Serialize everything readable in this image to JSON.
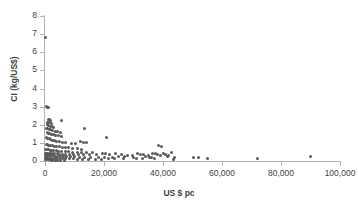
{
  "chart_data": {
    "type": "scatter",
    "title": "",
    "xlabel": "US $ pc",
    "ylabel": "CI (kg/US$)",
    "xlim": [
      0,
      100000
    ],
    "ylim": [
      0,
      8
    ],
    "xticks": [
      0,
      20000,
      40000,
      60000,
      80000,
      100000
    ],
    "xtick_labels": [
      "0",
      "20,000",
      "40,000",
      "60,000",
      "80,000",
      "100,000"
    ],
    "yticks": [
      0,
      1,
      2,
      3,
      4,
      5,
      6,
      7,
      8
    ],
    "ytick_labels": [
      "0",
      "1",
      "2",
      "3",
      "4",
      "5",
      "6",
      "7",
      "8"
    ],
    "grid": false,
    "legend": false,
    "marker_color": "#5a5a5a",
    "axis_color": "#b3b3b3",
    "series": [
      {
        "name": "Countries",
        "points": [
          [
            300,
            6.8
          ],
          [
            400,
            2.98
          ],
          [
            900,
            2.95
          ],
          [
            1300,
            2.93
          ],
          [
            1100,
            2.3
          ],
          [
            1500,
            2.27
          ],
          [
            1900,
            2.22
          ],
          [
            5500,
            2.25
          ],
          [
            1000,
            2.15
          ],
          [
            1400,
            2.1
          ],
          [
            2100,
            2.05
          ],
          [
            800,
            2.0
          ],
          [
            1200,
            1.96
          ],
          [
            1700,
            1.92
          ],
          [
            2400,
            1.9
          ],
          [
            3000,
            1.86
          ],
          [
            600,
            1.82
          ],
          [
            1000,
            1.78
          ],
          [
            1500,
            1.75
          ],
          [
            2000,
            1.72
          ],
          [
            2600,
            1.68
          ],
          [
            3400,
            1.65
          ],
          [
            4200,
            1.62
          ],
          [
            5100,
            1.6
          ],
          [
            700,
            1.55
          ],
          [
            1100,
            1.52
          ],
          [
            1600,
            1.5
          ],
          [
            2200,
            1.47
          ],
          [
            2900,
            1.44
          ],
          [
            3700,
            1.42
          ],
          [
            4600,
            1.38
          ],
          [
            5600,
            1.34
          ],
          [
            13500,
            1.8
          ],
          [
            21000,
            1.32
          ],
          [
            500,
            1.28
          ],
          [
            900,
            1.25
          ],
          [
            1400,
            1.22
          ],
          [
            1900,
            1.18
          ],
          [
            2500,
            1.15
          ],
          [
            3200,
            1.12
          ],
          [
            4000,
            1.08
          ],
          [
            4900,
            1.05
          ],
          [
            5900,
            1.02
          ],
          [
            7000,
            1.0
          ],
          [
            12000,
            1.05
          ],
          [
            13000,
            1.02
          ],
          [
            14000,
            1.0
          ],
          [
            9000,
            0.98
          ],
          [
            10500,
            0.96
          ],
          [
            400,
            0.92
          ],
          [
            800,
            0.9
          ],
          [
            1300,
            0.88
          ],
          [
            1800,
            0.86
          ],
          [
            2400,
            0.84
          ],
          [
            3100,
            0.82
          ],
          [
            3900,
            0.8
          ],
          [
            4800,
            0.78
          ],
          [
            5800,
            0.76
          ],
          [
            6900,
            0.74
          ],
          [
            8100,
            0.72
          ],
          [
            9400,
            0.7
          ],
          [
            11000,
            0.68
          ],
          [
            12500,
            0.66
          ],
          [
            38500,
            0.88
          ],
          [
            39500,
            0.78
          ],
          [
            300,
            0.66
          ],
          [
            700,
            0.64
          ],
          [
            1200,
            0.62
          ],
          [
            1700,
            0.6
          ],
          [
            2300,
            0.58
          ],
          [
            3000,
            0.57
          ],
          [
            3800,
            0.56
          ],
          [
            4700,
            0.55
          ],
          [
            5700,
            0.54
          ],
          [
            6800,
            0.52
          ],
          [
            8000,
            0.5
          ],
          [
            9300,
            0.49
          ],
          [
            10900,
            0.48
          ],
          [
            12400,
            0.47
          ],
          [
            14000,
            0.46
          ],
          [
            16000,
            0.45
          ],
          [
            200,
            0.44
          ],
          [
            600,
            0.43
          ],
          [
            1000,
            0.42
          ],
          [
            1500,
            0.42
          ],
          [
            2000,
            0.41
          ],
          [
            2600,
            0.4
          ],
          [
            3300,
            0.4
          ],
          [
            4100,
            0.39
          ],
          [
            5000,
            0.38
          ],
          [
            6000,
            0.38
          ],
          [
            7100,
            0.37
          ],
          [
            8300,
            0.36
          ],
          [
            9600,
            0.36
          ],
          [
            11200,
            0.35
          ],
          [
            13000,
            0.35
          ],
          [
            15000,
            0.34
          ],
          [
            17500,
            0.38
          ],
          [
            19500,
            0.42
          ],
          [
            20500,
            0.4
          ],
          [
            22000,
            0.38
          ],
          [
            24000,
            0.4
          ],
          [
            26000,
            0.36
          ],
          [
            28000,
            0.3
          ],
          [
            29500,
            0.28
          ],
          [
            31500,
            0.42
          ],
          [
            32500,
            0.38
          ],
          [
            33500,
            0.34
          ],
          [
            35000,
            0.3
          ],
          [
            36500,
            0.44
          ],
          [
            37500,
            0.4
          ],
          [
            38000,
            0.36
          ],
          [
            39000,
            0.32
          ],
          [
            40000,
            0.42
          ],
          [
            41000,
            0.36
          ],
          [
            42000,
            0.3
          ],
          [
            43000,
            0.46
          ],
          [
            44000,
            0.18
          ],
          [
            100,
            0.34
          ],
          [
            400,
            0.32
          ],
          [
            800,
            0.31
          ],
          [
            1200,
            0.3
          ],
          [
            1700,
            0.29
          ],
          [
            2200,
            0.28
          ],
          [
            2800,
            0.28
          ],
          [
            3500,
            0.27
          ],
          [
            4300,
            0.26
          ],
          [
            5200,
            0.26
          ],
          [
            6200,
            0.25
          ],
          [
            7300,
            0.24
          ],
          [
            8600,
            0.24
          ],
          [
            10000,
            0.23
          ],
          [
            11600,
            0.22
          ],
          [
            13500,
            0.22
          ],
          [
            15500,
            0.22
          ],
          [
            18000,
            0.21
          ],
          [
            20000,
            0.2
          ],
          [
            23000,
            0.22
          ],
          [
            25000,
            0.24
          ],
          [
            27000,
            0.26
          ],
          [
            30000,
            0.22
          ],
          [
            34000,
            0.24
          ],
          [
            36000,
            0.22
          ],
          [
            41500,
            0.24
          ],
          [
            150,
            0.2
          ],
          [
            500,
            0.18
          ],
          [
            900,
            0.17
          ],
          [
            1400,
            0.16
          ],
          [
            1900,
            0.16
          ],
          [
            2500,
            0.15
          ],
          [
            3200,
            0.15
          ],
          [
            4000,
            0.14
          ],
          [
            4900,
            0.14
          ],
          [
            5900,
            0.13
          ],
          [
            7000,
            0.13
          ],
          [
            8200,
            0.12
          ],
          [
            9500,
            0.12
          ],
          [
            11000,
            0.11
          ],
          [
            12800,
            0.11
          ],
          [
            14800,
            0.1
          ],
          [
            17000,
            0.1
          ],
          [
            19000,
            0.1
          ],
          [
            21500,
            0.12
          ],
          [
            23500,
            0.14
          ],
          [
            26500,
            0.16
          ],
          [
            31000,
            0.14
          ],
          [
            33000,
            0.12
          ],
          [
            35500,
            0.18
          ],
          [
            37000,
            0.14
          ],
          [
            43500,
            0.1
          ],
          [
            50500,
            0.2
          ],
          [
            52000,
            0.18
          ],
          [
            55000,
            0.14
          ],
          [
            72000,
            0.14
          ],
          [
            90000,
            0.24
          ],
          [
            250,
            0.08
          ],
          [
            600,
            0.07
          ],
          [
            1100,
            0.06
          ],
          [
            1600,
            0.06
          ],
          [
            2100,
            0.05
          ],
          [
            2700,
            0.05
          ],
          [
            3400,
            0.04
          ],
          [
            4200,
            0.04
          ],
          [
            5300,
            0.04
          ],
          [
            6500,
            0.03
          ]
        ]
      }
    ]
  }
}
